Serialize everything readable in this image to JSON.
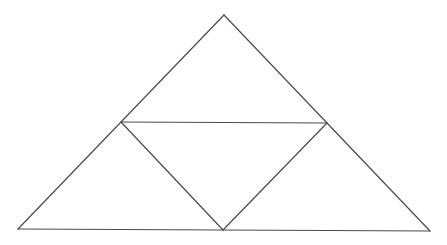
{
  "diagram": {
    "title": "",
    "stroke_color": "#4a4a4a",
    "background": "#ffffff",
    "vertices": {
      "apex": [
        224,
        15
      ],
      "left_mid": [
        121,
        122
      ],
      "right_mid": [
        327,
        123
      ],
      "bottom_left": [
        18,
        229
      ],
      "bottom_mid": [
        223,
        230
      ],
      "bottom_right": [
        430,
        231
      ]
    },
    "edges": [
      {
        "name": "outer-left-side",
        "from": "apex",
        "to": "bottom_left"
      },
      {
        "name": "outer-right-side",
        "from": "apex",
        "to": "bottom_right"
      },
      {
        "name": "outer-base",
        "from": "bottom_left",
        "to": "bottom_right"
      },
      {
        "name": "midline-top",
        "from": "left_mid",
        "to": "right_mid"
      },
      {
        "name": "inner-left-diagonal",
        "from": "left_mid",
        "to": "bottom_mid"
      },
      {
        "name": "inner-right-diagonal",
        "from": "right_mid",
        "to": "bottom_mid"
      }
    ]
  }
}
